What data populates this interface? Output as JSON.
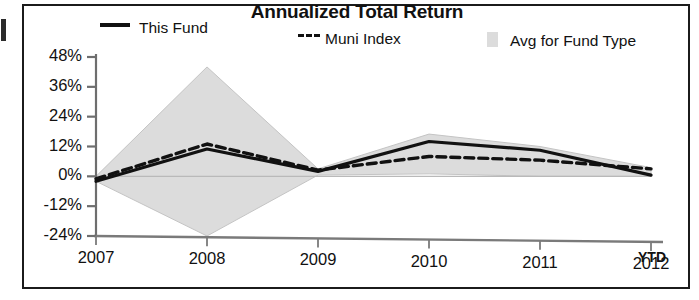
{
  "frame": {
    "present": true
  },
  "chart_data": {
    "type": "area",
    "title": "Annualized Total Return",
    "xlabel": "",
    "ylabel": "",
    "x": [
      "2007",
      "2008",
      "2009",
      "2010",
      "2011",
      "2012 YTD"
    ],
    "x_tick_labels": [
      "2007",
      "2008",
      "2009",
      "2010",
      "2011",
      "2012"
    ],
    "x_axis_suffix": "YTD",
    "y_tick_labels": [
      "48%",
      "36%",
      "24%",
      "12%",
      "0%",
      "-12%",
      "-24%"
    ],
    "y_tick_values": [
      48,
      36,
      24,
      12,
      0,
      -12,
      -24
    ],
    "ylim": [
      -24,
      48
    ],
    "grid": false,
    "legend_position": "top",
    "series": [
      {
        "name": "This Fund",
        "style": "solid",
        "color": "#111111",
        "values": [
          -2,
          11,
          2,
          14,
          10.5,
          0.5
        ]
      },
      {
        "name": "Muni Index",
        "style": "dashed",
        "color": "#111111",
        "values": [
          -1,
          13,
          2.5,
          8,
          6.5,
          3
        ]
      },
      {
        "name": "Avg for Fund Type",
        "style": "band",
        "color": "#dcdcdc",
        "upper": [
          0,
          44,
          3,
          17,
          12,
          3.5
        ],
        "lower": [
          -2,
          -24,
          0.5,
          1,
          0,
          0
        ]
      }
    ]
  },
  "legend": {
    "items": [
      {
        "label": "This Fund",
        "marker": "solid-line-swatch"
      },
      {
        "label": "Muni Index",
        "marker": "dashed-line-swatch"
      },
      {
        "label": "Avg for Fund Type",
        "marker": "gray-band-swatch"
      }
    ]
  }
}
